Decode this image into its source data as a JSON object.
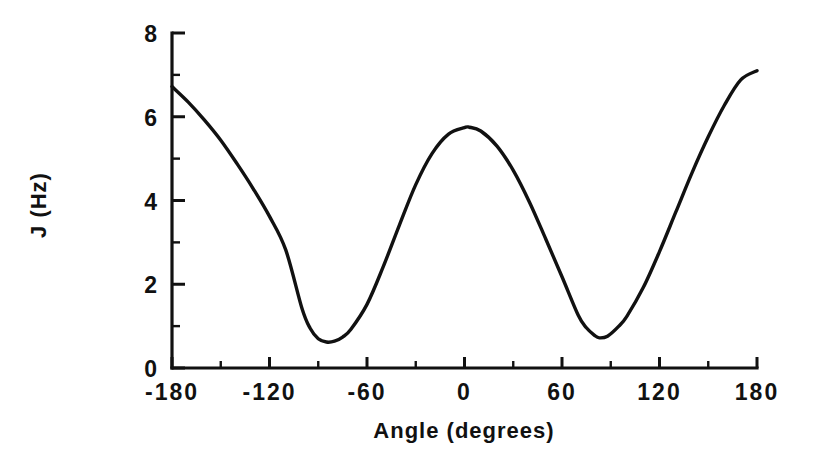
{
  "chart_data": {
    "type": "line",
    "title": "",
    "xlabel": "Angle  (degrees)",
    "ylabel": "J  (Hz)",
    "xlim": [
      -180,
      180
    ],
    "ylim": [
      0,
      8
    ],
    "grid": false,
    "legend": "none",
    "x_major_ticks": [
      -180,
      -120,
      -60,
      0,
      60,
      120,
      180
    ],
    "x_tick_labels": [
      "-180",
      "-120",
      "-60",
      "0",
      "60",
      "120",
      "180"
    ],
    "x_minor_tick_interval": 30,
    "y_major_ticks": [
      0,
      2,
      4,
      6,
      8
    ],
    "y_tick_labels": [
      "0",
      "2",
      "4",
      "6",
      "8"
    ],
    "y_minor_tick_interval": 1,
    "line_color": "#111111",
    "series": [
      {
        "name": "J coupling",
        "x": [
          -180,
          -170,
          -160,
          -150,
          -140,
          -130,
          -120,
          -110,
          -100,
          -95,
          -90,
          -85,
          -80,
          -75,
          -70,
          -60,
          -50,
          -40,
          -30,
          -20,
          -10,
          0,
          3,
          10,
          20,
          30,
          40,
          50,
          60,
          70,
          75,
          80,
          83,
          88,
          95,
          100,
          110,
          120,
          130,
          140,
          150,
          160,
          170,
          180
        ],
        "y": [
          6.72,
          6.35,
          5.92,
          5.44,
          4.88,
          4.28,
          3.62,
          2.82,
          1.42,
          0.95,
          0.7,
          0.62,
          0.64,
          0.74,
          0.92,
          1.52,
          2.42,
          3.42,
          4.38,
          5.12,
          5.58,
          5.74,
          5.75,
          5.66,
          5.3,
          4.72,
          3.96,
          3.08,
          2.18,
          1.26,
          0.96,
          0.78,
          0.72,
          0.76,
          1.0,
          1.24,
          1.92,
          2.78,
          3.72,
          4.66,
          5.52,
          6.28,
          6.88,
          7.1
        ]
      }
    ]
  },
  "axis_titles": {
    "x": "Angle  (degrees)",
    "y": "J  (Hz)"
  }
}
